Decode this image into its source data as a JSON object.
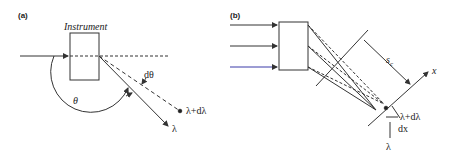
{
  "panel_a": {
    "label": "(a)",
    "instrument_label": "Instrument",
    "theta_label": "θ",
    "dtheta_label": "dθ",
    "lambda_plus_label": "λ+dλ",
    "lambda_label": "λ"
  },
  "panel_b": {
    "label": "(b)",
    "sc_label": "s",
    "sc_sub": "c",
    "x_label": "x",
    "lambda_plus_label": "λ+dλ",
    "dx_label": "dx",
    "lambda_label": "λ"
  },
  "colors": {
    "line": "#333333",
    "blue_ray": "#3a3aa8"
  }
}
